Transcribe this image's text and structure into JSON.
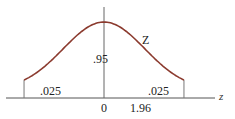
{
  "chart_data": {
    "type": "line",
    "title": "",
    "distribution": "standard normal",
    "curve_label": "Z",
    "xlabel": "z",
    "ylabel": "",
    "x_ticks": [
      "0",
      "1.96"
    ],
    "xlim": [
      -3.0,
      3.0
    ],
    "critical_values": [
      -1.96,
      1.96
    ],
    "regions": [
      {
        "name": "left-tail",
        "area_label": ".025",
        "area": 0.025
      },
      {
        "name": "center",
        "area_label": ".95",
        "area": 0.95
      },
      {
        "name": "right-tail",
        "area_label": ".025",
        "area": 0.025
      }
    ],
    "curve_color": "#8b3a2e",
    "axis_color": "#555555",
    "grid": false,
    "legend": "none"
  }
}
